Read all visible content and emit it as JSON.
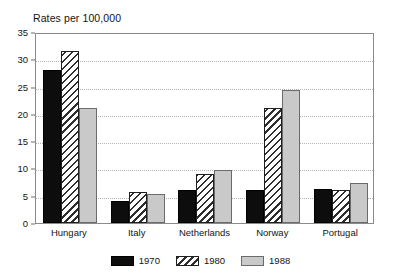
{
  "chart_data": {
    "type": "bar",
    "title": "Rates per 100,000",
    "xlabel": "",
    "ylabel": "",
    "ylim": [
      0,
      35
    ],
    "yticks": [
      0,
      5,
      10,
      15,
      20,
      25,
      30,
      35
    ],
    "grid": true,
    "legend_position": "bottom",
    "categories": [
      "Hungary",
      "Italy",
      "Netherlands",
      "Norway",
      "Portugal"
    ],
    "series": [
      {
        "name": "1970",
        "color": "#0d0d0d",
        "pattern": "solid-black",
        "values": [
          28,
          4,
          6,
          6,
          6.3
        ]
      },
      {
        "name": "1980",
        "color": "#ffffff",
        "pattern": "diagonal-hatch",
        "values": [
          31.5,
          5.6,
          9,
          21,
          6
        ]
      },
      {
        "name": "1988",
        "color": "#c9c9c9",
        "pattern": "solid-gray",
        "values": [
          21,
          5.3,
          9.8,
          24.3,
          7.3
        ]
      }
    ]
  },
  "colors": {
    "frame": "#8a8a8a",
    "gridline": "#b4b4b4",
    "text": "#141414",
    "series_1970": "#0d0d0d",
    "series_1980": "#ffffff",
    "series_1988": "#c9c9c9"
  }
}
